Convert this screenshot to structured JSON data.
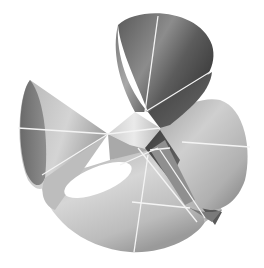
{
  "image": {
    "subject": "rendered 3D algebraic surface with four cone-shaped lobes and straight white lines",
    "background_color": "#ffffff",
    "palette": {
      "dark": "#4a4a4a",
      "mid_dark": "#6e6e6e",
      "mid": "#9a9a9a",
      "light": "#c8c8c8",
      "highlight": "#ececec",
      "line": "#f4f4f4"
    }
  },
  "surface": {
    "lobes": [
      "top-lobe",
      "left-lobe",
      "right-lobe",
      "bottom-lobe"
    ],
    "hole": "center-hole"
  }
}
